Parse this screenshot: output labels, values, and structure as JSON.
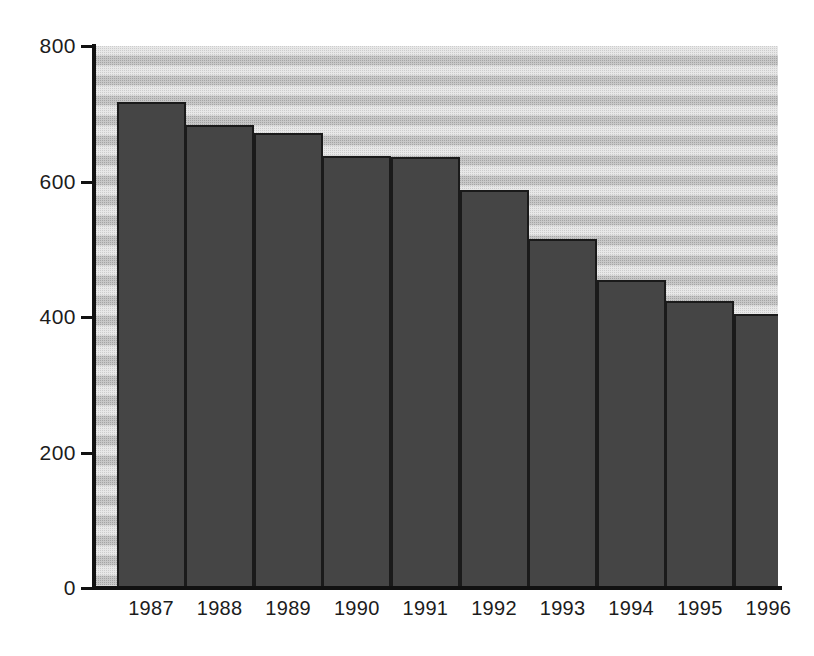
{
  "chart_data": {
    "type": "bar",
    "title": "",
    "subtitle": "",
    "xlabel": "",
    "ylabel": "",
    "categories": [
      "1987",
      "1988",
      "1989",
      "1990",
      "1991",
      "1992",
      "1993",
      "1994",
      "1995",
      "1996"
    ],
    "values": [
      718,
      684,
      672,
      637,
      636,
      588,
      515,
      454,
      423,
      404
    ],
    "series": [
      {
        "name": "",
        "values": [
          718,
          684,
          672,
          637,
          636,
          588,
          515,
          454,
          423,
          404
        ]
      }
    ],
    "ylim": [
      0,
      800
    ],
    "y_ticks": [
      0,
      200,
      400,
      600,
      800
    ],
    "y_tick_labels": [
      "0",
      "200",
      "400",
      "600",
      "800"
    ],
    "grid": false,
    "legend": false,
    "legend_position": "none",
    "bar_color": "#454545",
    "bar_border_color": "#1a1a1a",
    "plot_background_color": "#d8d8d8",
    "axis_color": "#111111",
    "text_color": "#1c1c1c",
    "annotations": []
  }
}
